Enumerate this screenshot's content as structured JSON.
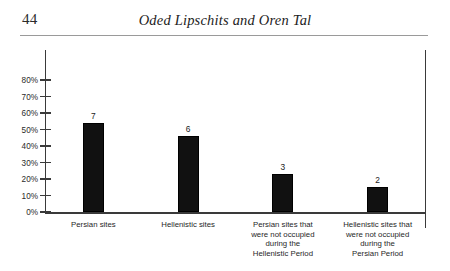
{
  "page": {
    "folio": "44",
    "running_title": "Oded Lipschits and Oren Tal"
  },
  "chart_data": {
    "type": "bar",
    "title": "",
    "xlabel": "",
    "ylabel": "",
    "ylim": [
      0,
      85
    ],
    "grid": false,
    "legend": null,
    "axis_tick_labels": [
      "0%",
      "10%",
      "20%",
      "30%",
      "40%",
      "50%",
      "60%",
      "70%",
      "80%"
    ],
    "axis_tick_values": [
      0,
      10,
      20,
      30,
      40,
      50,
      60,
      70,
      80
    ],
    "categories": [
      "Persian sites",
      "Hellenistic sites",
      "Persian sites that were not occupied during the Hellenistic Period",
      "Hellenistic sites that were not occupied during the Persian Period"
    ],
    "category_lines": [
      [
        "Persian sites"
      ],
      [
        "Hellenistic sites"
      ],
      [
        "Persian sites that",
        "were not occupied",
        "during the",
        "Hellenistic Period"
      ],
      [
        "Hellenistic sites that",
        "were not occupied",
        "during the",
        "Persian Period"
      ]
    ],
    "values": [
      54,
      46,
      23,
      15
    ],
    "data_labels": [
      "7",
      "6",
      "3",
      "2"
    ],
    "bar_color": "#111111"
  }
}
